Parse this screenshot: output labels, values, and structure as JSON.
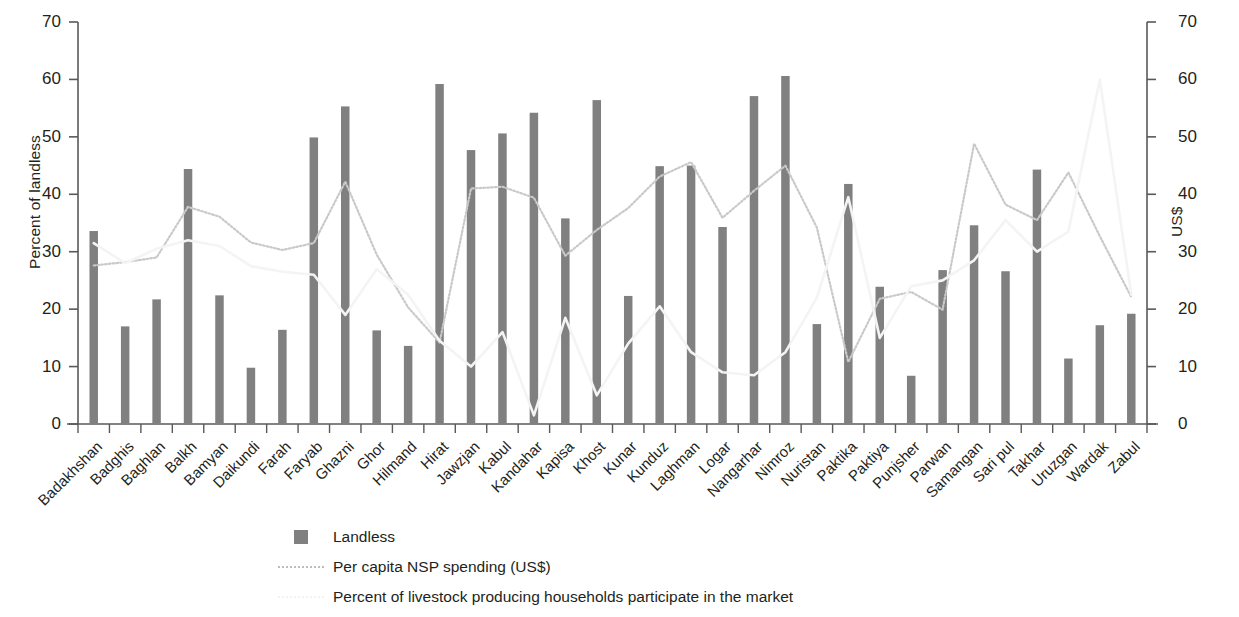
{
  "chart_data": {
    "type": "bar",
    "title": "",
    "subtitle": "",
    "xlabel": "",
    "ylabel": "Percent of landless",
    "ylabel_right": "US$",
    "ylim": [
      0,
      70
    ],
    "ylim_right": [
      0,
      70
    ],
    "yticks": [
      0,
      10,
      20,
      30,
      40,
      50,
      60,
      70
    ],
    "yticks_right": [
      0,
      10,
      20,
      30,
      40,
      50,
      60,
      70
    ],
    "grid": false,
    "legend_position": "bottom",
    "categories": [
      "Badakhshan",
      "Badghis",
      "Baghlan",
      "Balkh",
      "Bamyan",
      "Daikundi",
      "Farah",
      "Faryab",
      "Ghazni",
      "Ghor",
      "Hilmand",
      "Hirat",
      "Jawzjan",
      "Kabul",
      "Kandahar",
      "Kapisa",
      "Khost",
      "Kunar",
      "Kunduz",
      "Laghman",
      "Logar",
      "Nangarhar",
      "Nimroz",
      "Nuristan",
      "Paktika",
      "Paktiya",
      "Punjsher",
      "Parwan",
      "Samangan",
      "Sari pul",
      "Takhar",
      "Uruzgan",
      "Wardak",
      "Zabul"
    ],
    "series": [
      {
        "name": "Landless",
        "kind": "bar",
        "axis": "left",
        "color": "#808080",
        "values": [
          33.6,
          17.0,
          21.7,
          44.4,
          22.4,
          9.8,
          16.4,
          49.9,
          55.3,
          16.3,
          13.6,
          59.2,
          47.7,
          50.6,
          54.2,
          35.8,
          56.4,
          22.3,
          44.9,
          45.0,
          34.3,
          57.1,
          60.6,
          17.4,
          41.8,
          23.9,
          8.4,
          26.8,
          34.6,
          26.6,
          44.3,
          11.4,
          17.2,
          19.2
        ]
      },
      {
        "name": "Per capita NSP spending (US$)",
        "kind": "line",
        "axis": "right",
        "color": "#c9c9c9",
        "style": "dotted",
        "values": [
          27.6,
          28.2,
          29.0,
          37.8,
          36.1,
          31.6,
          30.3,
          31.5,
          42.2,
          29.5,
          20.3,
          14.2,
          41.0,
          41.3,
          39.4,
          29.3,
          33.8,
          37.6,
          43.1,
          45.6,
          35.9,
          40.6,
          45.0,
          34.2,
          10.8,
          21.8,
          23.0,
          19.9,
          48.8,
          38.2,
          35.5,
          43.8,
          32.7,
          22.1
        ]
      },
      {
        "name": "Percent of livestock producing households participate in the market",
        "kind": "line",
        "axis": "left",
        "color": "#f4f4f4",
        "style": "solid-light",
        "values": [
          31.5,
          28.0,
          30.5,
          32.0,
          31.0,
          27.5,
          26.5,
          26.0,
          19.0,
          27.0,
          22.5,
          14.5,
          10.0,
          16.0,
          1.5,
          18.5,
          5.0,
          14.0,
          20.5,
          12.5,
          9.0,
          8.5,
          12.5,
          22.0,
          39.5,
          15.0,
          24.0,
          25.0,
          28.5,
          35.5,
          30.0,
          33.5,
          60.0,
          22.5
        ]
      }
    ]
  },
  "legend": {
    "items": [
      {
        "label": "Landless",
        "key": "bar-swatch"
      },
      {
        "label": "Per capita NSP spending (US$)",
        "key": "dotted-line-swatch"
      },
      {
        "label": "Percent of livestock producing households participate in the market",
        "key": "faint-line-swatch"
      }
    ]
  }
}
